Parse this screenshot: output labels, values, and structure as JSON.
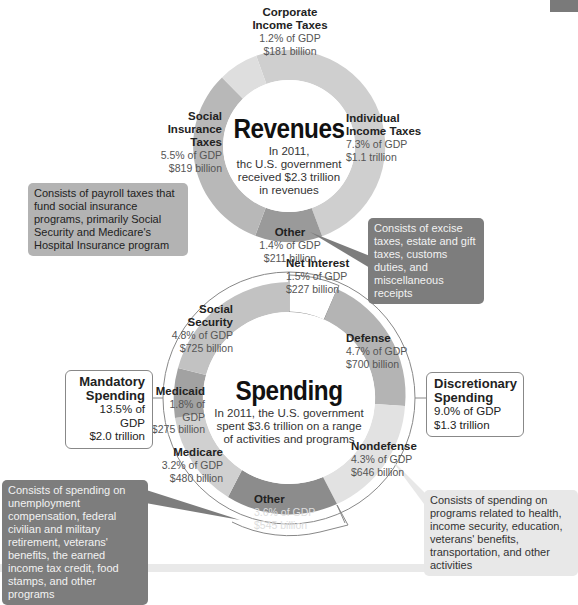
{
  "colors": {
    "revenue_corporate": "#dedede",
    "revenue_individual": "#cfcfcf",
    "revenue_other": "#9a9a9a",
    "revenue_social": "#b8b8b8",
    "spending_net_interest": "#ffffff",
    "spending_defense": "#b4b4b4",
    "spending_nondefense": "#e2e2e2",
    "spending_other": "#8c8c8c",
    "spending_medicare": "#d0d0d0",
    "spending_medicaid": "#a2a2a2",
    "spending_social_security": "#c2c2c2",
    "callout_mid": "#b3b3b3",
    "callout_dark": "#7d7d7d",
    "callout_light": "#e8e8e8"
  },
  "revenues": {
    "title": "Revenues",
    "subtitle": [
      "In 2011,",
      "thc U.S. government",
      "received $2.3 trillion",
      "in revenues"
    ],
    "segments": [
      {
        "name_lines": [
          "Corporate",
          "Income Taxes"
        ],
        "gdp": "1.2% of GDP",
        "amount": "$181 billion"
      },
      {
        "name_lines": [
          "Individual",
          "Income Taxes"
        ],
        "gdp": "7.3% of GDP",
        "amount": "$1.1 trillion"
      },
      {
        "name_lines": [
          "Other"
        ],
        "gdp": "1.4% of GDP",
        "amount": "$211 billion"
      },
      {
        "name_lines": [
          "Social",
          "Insurance Taxes"
        ],
        "gdp": "5.5% of GDP",
        "amount": "$819 billion"
      }
    ],
    "callouts": {
      "social": "Consists of payroll taxes that fund social insurance programs, primarily Social Security and Medicare's Hospital Insurance program",
      "other": "Consists of excise taxes, estate and gift taxes, customs duties, and miscellaneous receipts"
    }
  },
  "spending": {
    "title": "Spending",
    "subtitle": [
      "In 2011, the U.S. government",
      "spent $3.6 trillion on a range",
      "of activities and programs"
    ],
    "segments": [
      {
        "name_lines": [
          "Net Interest"
        ],
        "gdp": "1.5% of GDP",
        "amount": "$227 billion"
      },
      {
        "name_lines": [
          "Defense"
        ],
        "gdp": "4.7% of GDP",
        "amount": "$700 billion"
      },
      {
        "name_lines": [
          "Nondefense"
        ],
        "gdp": "4.3% of GDP",
        "amount": "$646 billion"
      },
      {
        "name_lines": [
          "Other"
        ],
        "gdp": "3.6% of GDP",
        "amount": "$545 billion"
      },
      {
        "name_lines": [
          "Medicare"
        ],
        "gdp": "3.2% of GDP",
        "amount": "$480 billion"
      },
      {
        "name_lines": [
          "Medicaid"
        ],
        "gdp": "1.8% of GDP",
        "amount": "$275 billion"
      },
      {
        "name_lines": [
          "Social",
          "Security"
        ],
        "gdp": "4.8% of GDP",
        "amount": "$725 billion"
      }
    ],
    "mandatory": {
      "title_lines": [
        "Mandatory",
        "Spending"
      ],
      "gdp": "13.5% of GDP",
      "amount": "$2.0 trillion"
    },
    "discretionary": {
      "title_lines": [
        "Discretionary",
        "Spending"
      ],
      "gdp": "9.0% of GDP",
      "amount": "$1.3 trillion"
    },
    "callouts": {
      "other": "Consists of spending on unemployment compensation, federal civilian and military retirement, veterans' benefits, the earned income tax credit, food stamps, and other programs",
      "nondefense": "Consists of spending on programs related to health, income security, education, veterans' benefits, transportation, and other activities"
    }
  }
}
